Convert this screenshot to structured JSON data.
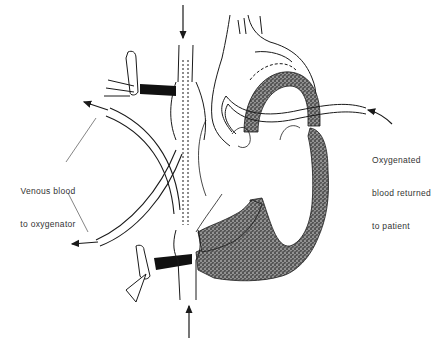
{
  "figure": {
    "type": "medical-line-illustration"
  },
  "labels": {
    "venous": {
      "line1": "Venous blood",
      "line2": "to oxygenator"
    },
    "arterial": {
      "line1": "Oxygenated",
      "line2": "blood returned",
      "line3": "to patient"
    }
  },
  "colors": {
    "ink": "#1a1a1a",
    "stipple": "#3a3a3a",
    "tourniquet": "#111111",
    "background": "#ffffff",
    "label_text": "#333333"
  }
}
